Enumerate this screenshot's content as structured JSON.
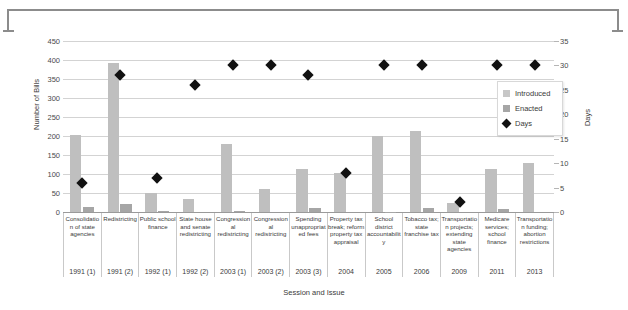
{
  "chart_data": {
    "type": "bar",
    "title": "",
    "xlabel": "Session and Issue",
    "ylabel": "Number of Bills",
    "y2label": "Days",
    "ylim": [
      0,
      450
    ],
    "y2lim": [
      0,
      35
    ],
    "grid": true,
    "legend_position": "inside-right",
    "y_ticks": [
      0,
      50,
      100,
      150,
      200,
      250,
      300,
      350,
      400,
      450
    ],
    "y2_ticks": [
      0,
      5,
      10,
      15,
      20,
      25,
      30,
      35
    ],
    "categories": [
      "1991 (1)",
      "1991 (2)",
      "1992 (1)",
      "1992 (2)",
      "2003 (1)",
      "2003 (2)",
      "2003 (3)",
      "2004",
      "2005",
      "2006",
      "2009",
      "2011",
      "2013"
    ],
    "issues": [
      "Consolidation of state agencies",
      "Redistricting",
      "Public school finance",
      "State house and senate redistricting",
      "Congressional redistricting",
      "Congressional redistricting",
      "Spending unappropriated fees",
      "Property tax break; reform property tax appraisal",
      "School district accountability",
      "Tobacco tax; state franchise tax",
      "Transportation projects; extending state agencies",
      "Medicare services; school finance",
      "Transportation funding; abortion restrictions"
    ],
    "series": [
      {
        "name": "Introduced",
        "axis": "left",
        "color": "#bfbfbf",
        "values": [
          202,
          393,
          50,
          33,
          180,
          60,
          113,
          103,
          201,
          212,
          24,
          113,
          130
        ]
      },
      {
        "name": "Enacted",
        "axis": "left",
        "color": "#a6a6a6",
        "values": [
          12,
          22,
          2,
          0,
          2,
          0,
          11,
          0,
          1,
          11,
          0,
          8,
          0
        ]
      },
      {
        "name": "Days",
        "axis": "right",
        "color": "#111111",
        "marker": "diamond",
        "values": [
          6,
          28,
          7,
          26,
          30,
          30,
          28,
          8,
          30,
          30,
          2,
          30,
          30
        ]
      }
    ]
  },
  "legend": {
    "items": [
      {
        "label": "Introduced",
        "swatch": "introduced"
      },
      {
        "label": "Enacted",
        "swatch": "enacted"
      },
      {
        "label": "Days",
        "swatch": "days"
      }
    ]
  },
  "colors": {
    "introduced": "#bfbfbf",
    "enacted": "#a6a6a6",
    "days": "#111111",
    "gridline": "#d3d3d3",
    "axis": "#9a9a9a",
    "text": "#3a3a3a"
  }
}
